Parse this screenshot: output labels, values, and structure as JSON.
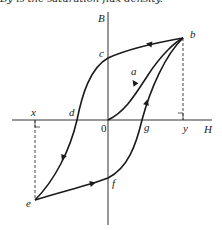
{
  "caption": "By is the saturation flux density.",
  "axes": {
    "vertical": "B",
    "horizontal": "H",
    "origin": "0"
  },
  "points": {
    "a": "a",
    "b": "b",
    "c": "c",
    "d": "d",
    "e": "e",
    "f": "f",
    "g": "g",
    "x": "x",
    "y": "y"
  },
  "colors": {
    "stroke": "#1a1a1a",
    "dashed": "#444444"
  }
}
